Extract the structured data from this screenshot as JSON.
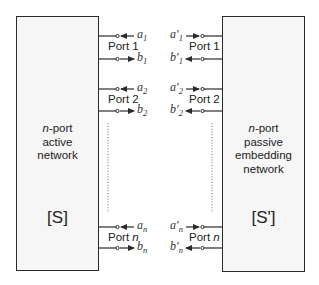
{
  "diagram": {
    "left_network": {
      "line1_italic": "n",
      "line1_rest": "-port",
      "line2": "active",
      "line3": "network",
      "matrix": "[S]"
    },
    "right_network": {
      "line1_italic": "n",
      "line1_rest": "-port",
      "line2": "passive",
      "line3": "embedding",
      "line4": "network",
      "matrix": "[S']"
    },
    "ports": [
      {
        "label": "Port 1",
        "a": "a",
        "a_sub": "1",
        "b": "b",
        "b_sub": "1",
        "a_prime": "a′",
        "a_prime_sub": "1",
        "b_prime": "b′",
        "b_prime_sub": "1"
      },
      {
        "label": "Port 2",
        "a": "a",
        "a_sub": "2",
        "b": "b",
        "b_sub": "2",
        "a_prime": "a′",
        "a_prime_sub": "2",
        "b_prime": "b′",
        "b_prime_sub": "2"
      },
      {
        "label_prefix": "Port ",
        "label_italic": "n",
        "a": "a",
        "a_sub": "n",
        "b": "b",
        "b_sub": "n",
        "a_prime": "a′",
        "a_prime_sub": "n",
        "b_prime": "b′",
        "b_prime_sub": "n"
      }
    ],
    "colors": {
      "line": "#2a2a2a",
      "box_fill": "#f6f6f6",
      "dotted": "#888888"
    }
  }
}
